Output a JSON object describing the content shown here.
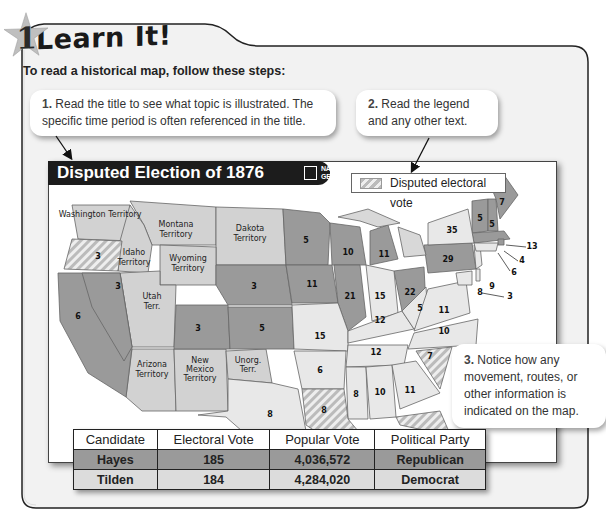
{
  "header": {
    "step_number": "1",
    "title": "Learn It!",
    "intro": "To read a historical map, follow these steps:"
  },
  "callouts": [
    {
      "number": "1.",
      "text": "Read the title to see what topic is illustrated. The specific time period is often referenced in the title."
    },
    {
      "number": "2.",
      "text": "Read the legend and any other text."
    },
    {
      "number": "3.",
      "text": "Notice how any movement, routes, or other information is indicated on the map."
    }
  ],
  "map": {
    "title": "Disputed Election of 1876",
    "publisher": "NATIONAL GEOGRAPHIC",
    "publisher_line1": "NATIONAL",
    "publisher_line2": "GEOGRAPHIC",
    "legend": {
      "label": "Disputed electoral vote"
    },
    "colors": {
      "hayes": "#9a9a9a",
      "tilden": "#e8e8e8",
      "territory": "#d2d2d2",
      "disputed": "#c8c8c8"
    },
    "territories": [
      "Washington Territory",
      "Montana Territory",
      "Dakota Territory",
      "Idaho Territory",
      "Wyoming Territory",
      "Utah Terr.",
      "Arizona Territory",
      "New Mexico Territory",
      "Unorg. Terr."
    ],
    "state_votes": {
      "OR": "3",
      "CA": "6",
      "NV": "3",
      "CO": "3",
      "NE": "3",
      "KS": "5",
      "MN": "5",
      "IA": "11",
      "WI": "10",
      "MI": "11",
      "IL": "21",
      "IN": "15",
      "OH": "22",
      "PA": "29",
      "NY": "35",
      "VT": "5",
      "NH": "5",
      "ME": "7",
      "MA": "13",
      "RI": "4",
      "CT": "6",
      "NJ": "9",
      "DE": "3",
      "MD": "8",
      "WV": "5",
      "VA": "11",
      "NC": "10",
      "SC": "7",
      "KY": "12",
      "TN": "12",
      "MO": "15",
      "AR": "6",
      "LA": "8",
      "MS": "8",
      "AL": "10",
      "GA": "11",
      "FL": "4",
      "TX": "8"
    }
  },
  "table": {
    "headers": [
      "Candidate",
      "Electoral Vote",
      "Popular Vote",
      "Political Party"
    ],
    "rows": [
      [
        "Hayes",
        "185",
        "4,036,572",
        "Republican"
      ],
      [
        "Tilden",
        "184",
        "4,284,020",
        "Democrat"
      ]
    ]
  }
}
